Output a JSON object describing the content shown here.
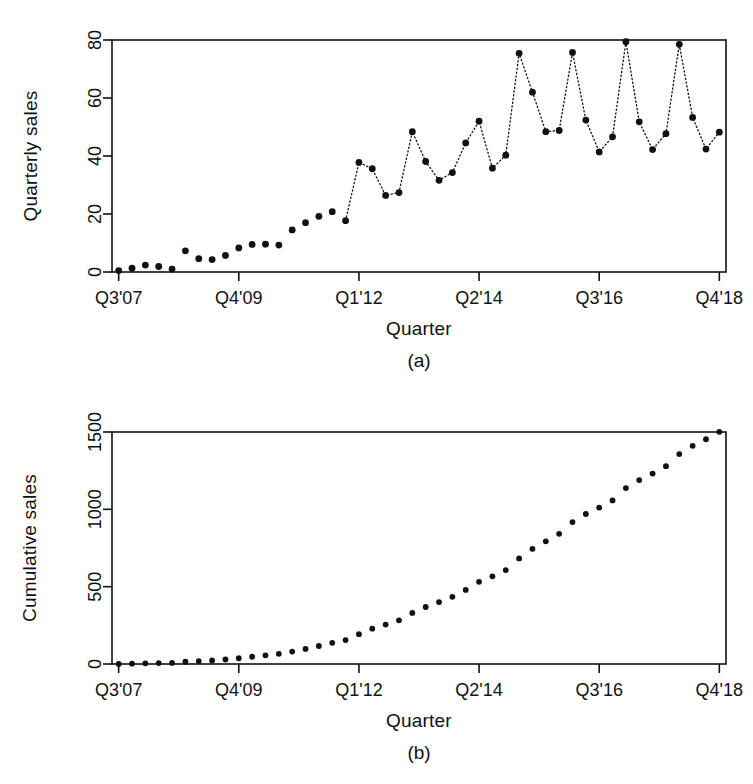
{
  "figure": {
    "background": "#ffffff",
    "ink_color": "#111111"
  },
  "panels": [
    {
      "id": "a",
      "caption": "(a)",
      "xlabel": "Quarter",
      "ylabel": "Quarterly sales"
    },
    {
      "id": "b",
      "caption": "(b)",
      "xlabel": "Quarter",
      "ylabel": "Cumulative sales"
    }
  ],
  "chart_data": [
    {
      "type": "scatter",
      "panel": "a",
      "title": "",
      "xlabel": "Quarter",
      "ylabel": "Quarterly sales",
      "ylim": [
        0,
        80
      ],
      "yticks": [
        0,
        20,
        40,
        60,
        80
      ],
      "ytick_labels": [
        "0",
        "20",
        "40",
        "60",
        "80"
      ],
      "xticks": [
        0,
        9,
        18,
        27,
        36,
        45
      ],
      "xtick_labels": [
        "Q3'07",
        "Q4'09",
        "Q1'12",
        "Q2'14",
        "Q3'16",
        "Q4'18"
      ],
      "grid": false,
      "legend": null,
      "connector": "dotted-line-after-index-17",
      "marker": "filled-circle",
      "x": [
        "Q3'07",
        "Q4'07",
        "Q1'08",
        "Q2'08",
        "Q3'08",
        "Q4'08",
        "Q1'09",
        "Q2'09",
        "Q3'09",
        "Q4'09",
        "Q1'10",
        "Q2'10",
        "Q3'10",
        "Q4'10",
        "Q1'11",
        "Q2'11",
        "Q3'11",
        "Q4'11",
        "Q1'12",
        "Q2'12",
        "Q3'12",
        "Q4'12",
        "Q1'13",
        "Q2'13",
        "Q3'13",
        "Q4'13",
        "Q1'14",
        "Q2'14",
        "Q3'14",
        "Q4'14",
        "Q1'15",
        "Q2'15",
        "Q3'15",
        "Q4'15",
        "Q1'16",
        "Q2'16",
        "Q3'16",
        "Q4'16",
        "Q1'17",
        "Q2'17",
        "Q3'17",
        "Q4'17",
        "Q1'18",
        "Q2'18",
        "Q3'18",
        "Q4'18"
      ],
      "values": [
        0.5,
        1.3,
        2.4,
        1.9,
        1.0,
        7.3,
        4.6,
        4.3,
        5.7,
        8.3,
        9.5,
        9.6,
        9.3,
        14.5,
        17.0,
        19.2,
        20.8,
        17.7,
        37.8,
        35.6,
        26.4,
        27.4,
        48.4,
        38.1,
        31.6,
        34.3,
        44.5,
        52.0,
        35.8,
        40.3,
        75.4,
        62.0,
        48.4,
        48.8,
        75.7,
        52.4,
        41.4,
        46.6,
        79.4,
        51.8,
        42.2,
        47.7,
        78.5,
        53.3,
        42.4,
        48.2
      ]
    },
    {
      "type": "scatter",
      "panel": "b",
      "title": "",
      "xlabel": "Quarter",
      "ylabel": "Cumulative sales",
      "ylim": [
        0,
        1500
      ],
      "yticks": [
        0,
        500,
        1000,
        1500
      ],
      "ytick_labels": [
        "0",
        "500",
        "1000",
        "1500"
      ],
      "xticks": [
        0,
        9,
        18,
        27,
        36,
        45
      ],
      "xtick_labels": [
        "Q3'07",
        "Q4'09",
        "Q1'12",
        "Q2'14",
        "Q3'16",
        "Q4'18"
      ],
      "grid": false,
      "legend": null,
      "marker": "filled-circle",
      "x": [
        "Q3'07",
        "Q4'07",
        "Q1'08",
        "Q2'08",
        "Q3'08",
        "Q4'08",
        "Q1'09",
        "Q2'09",
        "Q3'09",
        "Q4'09",
        "Q1'10",
        "Q2'10",
        "Q3'10",
        "Q4'10",
        "Q1'11",
        "Q2'11",
        "Q3'11",
        "Q4'11",
        "Q1'12",
        "Q2'12",
        "Q3'12",
        "Q4'12",
        "Q1'13",
        "Q2'13",
        "Q3'13",
        "Q4'13",
        "Q1'14",
        "Q2'14",
        "Q3'14",
        "Q4'14",
        "Q1'15",
        "Q2'15",
        "Q3'15",
        "Q4'15",
        "Q1'16",
        "Q2'16",
        "Q3'16",
        "Q4'16",
        "Q1'17",
        "Q2'17",
        "Q3'17",
        "Q4'17",
        "Q1'18",
        "Q2'18",
        "Q3'18",
        "Q4'18"
      ],
      "values": [
        0.5,
        1.8,
        4.2,
        6.1,
        7.1,
        14.4,
        19.0,
        23.3,
        29.0,
        37.3,
        46.8,
        56.4,
        65.7,
        80.2,
        97.2,
        116.4,
        137.2,
        154.9,
        192.7,
        228.3,
        254.7,
        282.1,
        330.5,
        368.6,
        400.2,
        434.5,
        479.0,
        531.0,
        566.8,
        607.1,
        682.5,
        744.5,
        792.9,
        841.7,
        917.4,
        969.8,
        1011.2,
        1057.8,
        1137.2,
        1189.0,
        1231.2,
        1278.9,
        1357.4,
        1410.7,
        1453.1,
        1501.3
      ]
    }
  ]
}
